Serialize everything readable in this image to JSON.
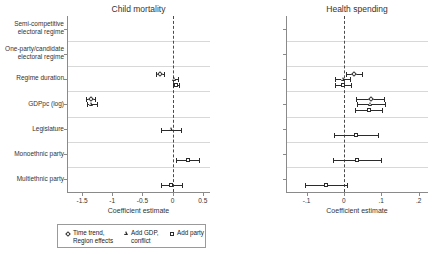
{
  "figure": {
    "xlabel": "Coefficient estimate"
  },
  "legend": {
    "items": [
      {
        "label": "Time trend,\nRegion effects",
        "marker": "diamond-marker-icon"
      },
      {
        "label": "Add GDP,\nconflict",
        "marker": "triangle-marker-icon"
      },
      {
        "label": "Add party",
        "marker": "square-marker-icon"
      }
    ]
  },
  "categories": [
    "Semi-competitive\nelectoral regime",
    "One-party/candidate\nelectoral regime",
    "Regime duration",
    "GDPpc (log)",
    "Legislature",
    "Monoethnic party",
    "Multiethnic party"
  ],
  "chart_data": [
    {
      "type": "scatter",
      "title": "Child mortality",
      "xlabel": "Coefficient estimate",
      "ylabel": "",
      "xlim": [
        -1.75,
        0.62
      ],
      "xticks": [
        -1.5,
        -1,
        -0.5,
        0,
        0.5
      ],
      "xticklabels": [
        "-1.5",
        "-1",
        "-0.5",
        "0",
        "0.5"
      ],
      "grid": true,
      "zero_reference": 0,
      "categories": [
        "Semi-competitive electoral regime",
        "One-party/candidate electoral regime",
        "Regime duration",
        "GDPpc (log)",
        "Legislature",
        "Monoethnic party",
        "Multiethnic party"
      ],
      "series": [
        {
          "name": "Time trend, Region effects",
          "marker": "diamond",
          "points": [
            {
              "category": "Semi-competitive electoral regime",
              "estimate": -0.44,
              "low": -0.62,
              "high": -0.26
            },
            {
              "category": "One-party/candidate electoral regime",
              "estimate": -0.02,
              "low": -0.26,
              "high": 0.23
            },
            {
              "category": "Regime duration",
              "estimate": -0.21,
              "low": -0.27,
              "high": -0.15
            },
            {
              "category": "GDPpc (log)",
              "estimate": -1.36,
              "low": -1.44,
              "high": -1.28
            },
            {
              "category": "Legislature",
              "estimate": null,
              "low": null,
              "high": null
            },
            {
              "category": "Monoethnic party",
              "estimate": null,
              "low": null,
              "high": null
            },
            {
              "category": "Multiethnic party",
              "estimate": null,
              "low": null,
              "high": null
            }
          ]
        },
        {
          "name": "Add GDP, conflict",
          "marker": "triangle",
          "points": [
            {
              "category": "Semi-competitive electoral regime",
              "estimate": -0.49,
              "low": -0.64,
              "high": -0.32
            },
            {
              "category": "One-party/candidate electoral regime",
              "estimate": -0.14,
              "low": -0.3,
              "high": 0.01
            },
            {
              "category": "Regime duration",
              "estimate": 0.04,
              "low": 0.0,
              "high": 0.09
            },
            {
              "category": "GDPpc (log)",
              "estimate": -1.34,
              "low": -1.42,
              "high": -1.26
            },
            {
              "category": "Legislature",
              "estimate": -0.02,
              "low": -0.2,
              "high": 0.14
            },
            {
              "category": "Monoethnic party",
              "estimate": null,
              "low": null,
              "high": null
            },
            {
              "category": "Multiethnic party",
              "estimate": null,
              "low": null,
              "high": null
            }
          ]
        },
        {
          "name": "Add party",
          "marker": "square",
          "points": [
            {
              "category": "Semi-competitive electoral regime",
              "estimate": -0.53,
              "low": -0.67,
              "high": -0.37
            },
            {
              "category": "One-party/candidate electoral regime",
              "estimate": -0.1,
              "low": -0.27,
              "high": 0.06
            },
            {
              "category": "Regime duration",
              "estimate": 0.05,
              "low": 0.0,
              "high": 0.1
            },
            {
              "category": "GDPpc (log)",
              "estimate": null,
              "low": null,
              "high": null
            },
            {
              "category": "Legislature",
              "estimate": null,
              "low": null,
              "high": null
            },
            {
              "category": "Monoethnic party",
              "estimate": 0.25,
              "low": 0.06,
              "high": 0.43
            },
            {
              "category": "Multiethnic party",
              "estimate": -0.02,
              "low": -0.2,
              "high": 0.15
            }
          ]
        }
      ]
    },
    {
      "type": "scatter",
      "title": "Health spending",
      "xlabel": "Coefficient estimate",
      "ylabel": "",
      "xlim": [
        -0.155,
        0.225
      ],
      "xticks": [
        -0.1,
        0,
        0.1,
        0.2
      ],
      "xticklabels": [
        "-.1",
        "0",
        ".1",
        ".2"
      ],
      "grid": true,
      "zero_reference": 0,
      "categories": [
        "Semi-competitive electoral regime",
        "One-party/candidate electoral regime",
        "Regime duration",
        "GDPpc (log)",
        "Legislature",
        "Monoethnic party",
        "Multiethnic party"
      ],
      "series": [
        {
          "name": "Time trend, Region effects",
          "marker": "diamond",
          "points": [
            {
              "category": "Semi-competitive electoral regime",
              "estimate": 0.072,
              "low": 0.022,
              "high": 0.122
            },
            {
              "category": "One-party/candidate electoral regime",
              "estimate": 0.072,
              "low": 0.021,
              "high": 0.123
            },
            {
              "category": "Regime duration",
              "estimate": 0.028,
              "low": 0.006,
              "high": 0.048
            },
            {
              "category": "GDPpc (log)",
              "estimate": 0.072,
              "low": 0.033,
              "high": 0.108
            },
            {
              "category": "Legislature",
              "estimate": null,
              "low": null,
              "high": null
            },
            {
              "category": "Monoethnic party",
              "estimate": null,
              "low": null,
              "high": null
            },
            {
              "category": "Multiethnic party",
              "estimate": null,
              "low": null,
              "high": null
            }
          ]
        },
        {
          "name": "Add GDP, conflict",
          "marker": "triangle",
          "points": [
            {
              "category": "Semi-competitive electoral regime",
              "estimate": 0.079,
              "low": 0.027,
              "high": 0.131
            },
            {
              "category": "One-party/candidate electoral regime",
              "estimate": 0.093,
              "low": 0.036,
              "high": 0.152
            },
            {
              "category": "Regime duration",
              "estimate": -0.002,
              "low": -0.024,
              "high": 0.017
            },
            {
              "category": "GDPpc (log)",
              "estimate": 0.072,
              "low": 0.034,
              "high": 0.109
            },
            {
              "category": "Legislature",
              "estimate": null,
              "low": null,
              "high": null
            },
            {
              "category": "Monoethnic party",
              "estimate": null,
              "low": null,
              "high": null
            },
            {
              "category": "Multiethnic party",
              "estimate": null,
              "low": null,
              "high": null
            }
          ]
        },
        {
          "name": "Add party",
          "marker": "square",
          "points": [
            {
              "category": "Semi-competitive electoral regime",
              "estimate": 0.089,
              "low": 0.03,
              "high": 0.149
            },
            {
              "category": "One-party/candidate electoral regime",
              "estimate": 0.104,
              "low": 0.04,
              "high": 0.17
            },
            {
              "category": "Regime duration",
              "estimate": -0.002,
              "low": -0.025,
              "high": 0.02
            },
            {
              "category": "GDPpc (log)",
              "estimate": 0.066,
              "low": 0.029,
              "high": 0.103
            },
            {
              "category": "Legislature",
              "estimate": 0.031,
              "low": -0.026,
              "high": 0.09
            },
            {
              "category": "Monoethnic party",
              "estimate": 0.035,
              "low": -0.028,
              "high": 0.1
            },
            {
              "category": "Multiethnic party",
              "estimate": -0.049,
              "low": -0.105,
              "high": 0.009
            }
          ]
        }
      ]
    }
  ]
}
